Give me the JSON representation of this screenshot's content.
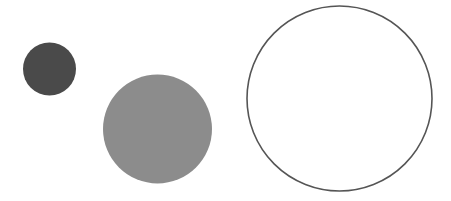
{
  "canvas": {
    "width": 451,
    "height": 201,
    "background": "#ffffff"
  },
  "shapes": [
    {
      "id": "small-dark-circle",
      "type": "circle",
      "cx": 49.5,
      "cy": 69,
      "r": 26.5,
      "fill": "#4a4a4a",
      "stroke": "none",
      "stroke_width": 0
    },
    {
      "id": "medium-gray-circle",
      "type": "circle",
      "cx": 157.5,
      "cy": 129,
      "r": 54.5,
      "fill": "#8c8c8c",
      "stroke": "none",
      "stroke_width": 0
    },
    {
      "id": "large-outline-circle",
      "type": "circle",
      "cx": 339.5,
      "cy": 98.5,
      "r": 92.5,
      "fill": "none",
      "stroke": "#555555",
      "stroke_width": 1.6
    }
  ]
}
